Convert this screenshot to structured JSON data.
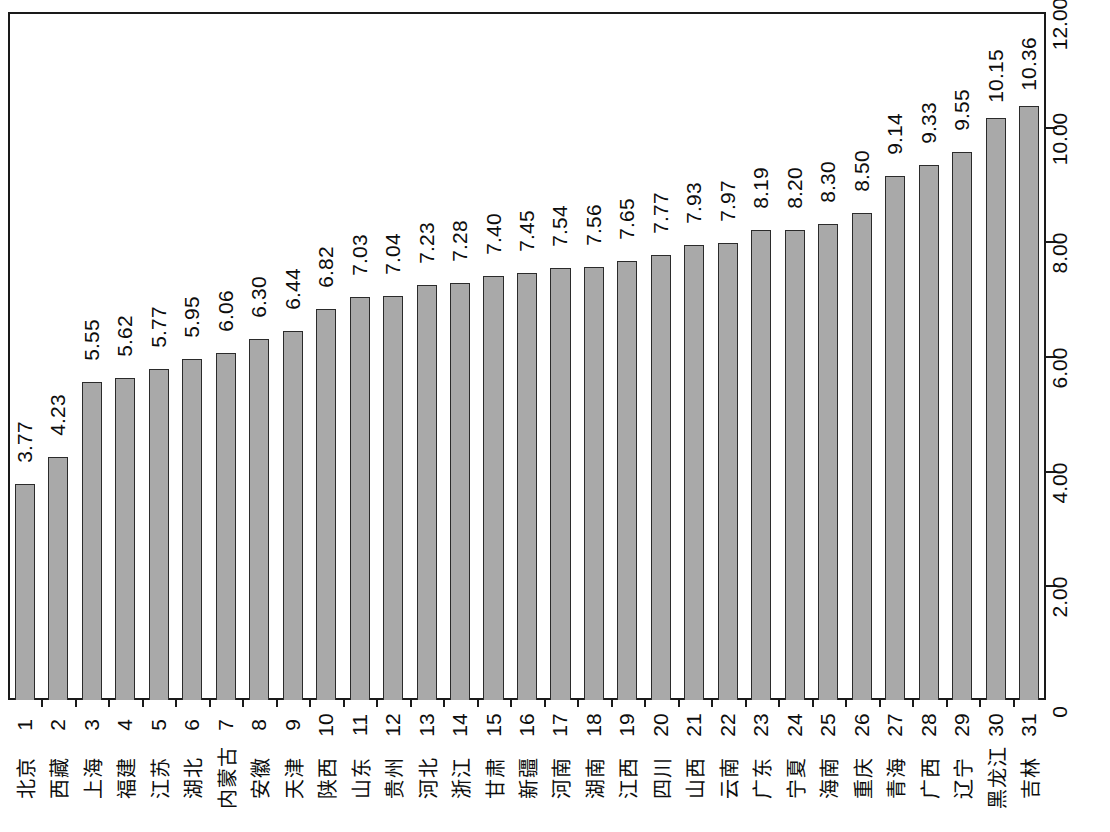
{
  "chart_data": {
    "type": "bar",
    "title": "",
    "subtitle": "",
    "xlabel": "",
    "ylabel": "",
    "ylim": [
      0,
      12
    ],
    "grid": false,
    "legend": null,
    "y_axis_position": "right",
    "y_ticks": [
      "0",
      "2.00",
      "4.00",
      "6.00",
      "8.00",
      "10.00",
      "12.00"
    ],
    "y_tick_values": [
      0,
      2,
      4,
      6,
      8,
      10,
      12
    ],
    "ranks": [
      "1",
      "2",
      "3",
      "4",
      "5",
      "6",
      "7",
      "8",
      "9",
      "10",
      "11",
      "12",
      "13",
      "14",
      "15",
      "16",
      "17",
      "18",
      "19",
      "20",
      "21",
      "22",
      "23",
      "24",
      "25",
      "26",
      "27",
      "28",
      "29",
      "30",
      "31"
    ],
    "categories": [
      "北京",
      "西藏",
      "上海",
      "福建",
      "江苏",
      "湖北",
      "内蒙古",
      "安徽",
      "天津",
      "陕西",
      "山东",
      "贵州",
      "河北",
      "浙江",
      "甘肃",
      "新疆",
      "河南",
      "湖南",
      "江西",
      "四川",
      "山西",
      "云南",
      "广东",
      "宁夏",
      "海南",
      "重庆",
      "青海",
      "广西",
      "辽宁",
      "黑龙江",
      "吉林"
    ],
    "values": [
      3.77,
      4.23,
      5.55,
      5.62,
      5.77,
      5.95,
      6.06,
      6.3,
      6.44,
      6.82,
      7.03,
      7.04,
      7.23,
      7.28,
      7.4,
      7.45,
      7.54,
      7.56,
      7.65,
      7.77,
      7.93,
      7.97,
      8.19,
      8.2,
      8.3,
      8.5,
      9.14,
      9.33,
      9.55,
      10.15,
      10.36
    ],
    "value_labels": [
      "3.77",
      "4.23",
      "5.55",
      "5.62",
      "5.77",
      "5.95",
      "6.06",
      "6.30",
      "6.44",
      "6.82",
      "7.03",
      "7.04",
      "7.23",
      "7.28",
      "7.40",
      "7.45",
      "7.54",
      "7.56",
      "7.65",
      "7.77",
      "7.93",
      "7.97",
      "8.19",
      "8.20",
      "8.30",
      "8.50",
      "9.14",
      "9.33",
      "9.55",
      "10.15",
      "10.36"
    ],
    "colors": {
      "bar_fill": "#a9a9a9",
      "bar_border": "#2b2b2b",
      "axis": "#1a1a1a",
      "text": "#0d0d0d",
      "background": "#ffffff"
    }
  }
}
